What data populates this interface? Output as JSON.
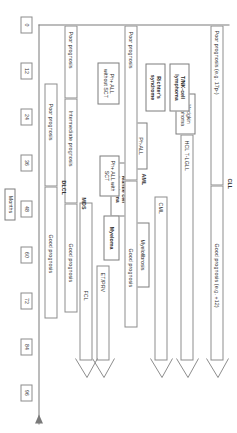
{
  "figure": {
    "title": "",
    "axis": {
      "label": "Months",
      "ticks": [
        "0",
        "12",
        "24",
        "36",
        "48",
        "60",
        "72",
        "84",
        "96"
      ],
      "arrow": true
    },
    "rows": [
      {
        "id": "cll",
        "name": "CLL",
        "name_bold": true,
        "continues": true,
        "segments": [
          {
            "label": "Poor prognosis (e.g. 17p-)"
          },
          {
            "label": "Good prognosis (e.g. +12)"
          }
        ]
      },
      {
        "id": "hodgkin",
        "name": "Hodgkin lymphoma",
        "name_bold": false,
        "continues": false,
        "segments": []
      },
      {
        "id": "hcl",
        "name": "HCL T-LGLL",
        "name_bold": false,
        "continues": true,
        "segments": []
      },
      {
        "id": "cml",
        "name": "CML",
        "name_bold": false,
        "continues": true,
        "segments": []
      },
      {
        "id": "aml",
        "name": "AML",
        "name_bold": true,
        "continues": false,
        "segments": [
          {
            "label": "Poor prognosis"
          },
          {
            "label": "Good prognosis"
          }
        ]
      },
      {
        "id": "etprv",
        "name": "ET/PRV",
        "name_bold": false,
        "continues": true,
        "segments": []
      },
      {
        "id": "fcl",
        "name": "FCL",
        "name_bold": false,
        "continues": true,
        "segments": []
      },
      {
        "id": "mds",
        "name": "MDS",
        "name_bold": true,
        "continues": false,
        "segments": [
          {
            "label": "Poor prognosis"
          },
          {
            "label": "Intermediate prognosis"
          },
          {
            "label": "Good prognosis"
          }
        ]
      },
      {
        "id": "dlcl",
        "name": "DLCL",
        "name_bold": true,
        "continues": false,
        "segments": [
          {
            "label": "Poor prognosis"
          },
          {
            "label": "Good prognosis"
          }
        ]
      }
    ],
    "standalone_boxes": [
      {
        "id": "tnk",
        "label": "T/NK-cell lymphoma",
        "bold": true
      },
      {
        "id": "richter",
        "label": "Richter's syndrome",
        "bold": true
      },
      {
        "id": "ph-all",
        "label": "Ph-ALL",
        "bold": false
      },
      {
        "id": "mantle",
        "label": "Mantle cell lymphoma",
        "bold": true
      },
      {
        "id": "myelofibrosis",
        "label": "Myelofibrosis",
        "bold": false
      },
      {
        "id": "ph-all-sct",
        "label": "Ph+ ALL with SCT",
        "bold": false
      },
      {
        "id": "ph-all-nosct",
        "label": "Ph+ ALL without SCT",
        "bold": false
      },
      {
        "id": "myeloma",
        "label": "Myeloma",
        "bold": true
      }
    ]
  }
}
